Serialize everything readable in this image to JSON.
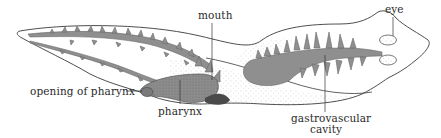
{
  "diagram": {
    "labels": {
      "mouth": "mouth",
      "eye": "eye",
      "opening_of_pharynx": "opening of pharynx",
      "pharynx": "pharynx",
      "gastrovascular_line1": "gastrovascular",
      "gastrovascular_line2": "cavity"
    },
    "colors": {
      "outline": "#3a3a3a",
      "gut_fill": "#8f8f8f",
      "stipple": "#b0b0b0",
      "background": "#ffffff",
      "text": "#2a2a2a"
    }
  }
}
